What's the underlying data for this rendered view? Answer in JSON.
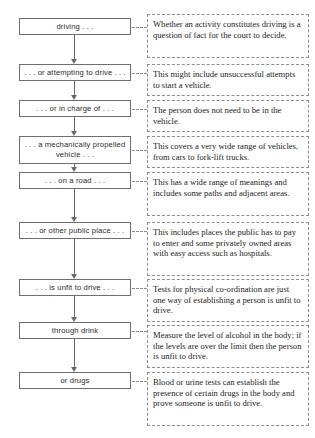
{
  "diagram": {
    "flow_steps": [
      {
        "id": "driving",
        "label": "driving . . ."
      },
      {
        "id": "attempting-to-drive",
        "label": ". . . or attempting to drive . . ."
      },
      {
        "id": "in-charge-of",
        "label": ". . . or in charge of . . ."
      },
      {
        "id": "mechanically-propelled-vehicle",
        "label": ". . . a mechanically propelled\nvehicle . . ."
      },
      {
        "id": "on-a-road",
        "label": ". . . on a road . . ."
      },
      {
        "id": "other-public-place",
        "label": ". . . or other public place . . ."
      },
      {
        "id": "unfit-to-drive",
        "label": ". . . is unfit to drive . . ."
      },
      {
        "id": "through-drink",
        "label": "through drink"
      },
      {
        "id": "or-drugs",
        "label": "or drugs"
      }
    ],
    "notes": [
      {
        "id": "note-driving",
        "text": "Whether an activity constitutes driving is a question of fact for the court to decide."
      },
      {
        "id": "note-attempting",
        "text": "This might include unsuccessful attempts to start a vehicle."
      },
      {
        "id": "note-in-charge",
        "text": "The person does not need to be in the vehicle."
      },
      {
        "id": "note-vehicle",
        "text": "This covers a very wide range of vehicles, from cars to fork-lift trucks."
      },
      {
        "id": "note-road",
        "text": "This has a wide range of meanings and includes some paths and adjacent areas."
      },
      {
        "id": "note-public-place",
        "text": "This includes places the public has to pay to enter and some privately owned areas with easy access such as hospitals."
      },
      {
        "id": "note-unfit",
        "text": "Tests for physical co-ordination are just one way of establishing a person is unfit to drive."
      },
      {
        "id": "note-drink",
        "text": "Measure the level of alcohol in the body; if the levels are over the limit then the person is unfit to drive."
      },
      {
        "id": "note-drugs",
        "text": "Blood or urine tests can establish the presence of certain drugs in the body and prove someone is unfit to drive."
      }
    ],
    "colors": {
      "flow_box_border": "#6f6f6f",
      "note_box_border": "#8d8d8d",
      "arrow": "#6a6a6a",
      "background": "#ffffff",
      "flow_text": "#2b2b2b",
      "note_text": "#1d1d1d"
    }
  }
}
